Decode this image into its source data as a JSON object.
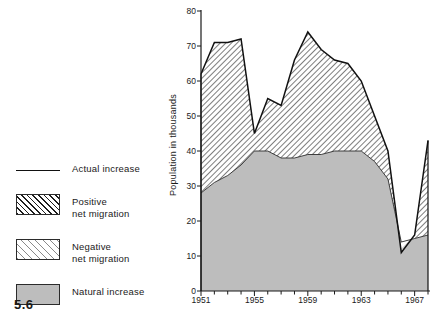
{
  "figure_number": "5.6",
  "legend": {
    "items": [
      {
        "label": "Actual increase",
        "swatch": "solid-line-swatch",
        "style": "line"
      },
      {
        "label": "Positive\nnet migration",
        "swatch": "dense-hatch-swatch",
        "style": "pos"
      },
      {
        "label": "Negative\nnet migration",
        "swatch": "sparse-hatch-swatch",
        "style": "neg"
      },
      {
        "label": "Natural increase",
        "swatch": "solid-gray-swatch",
        "style": "nat"
      }
    ]
  },
  "colors": {
    "natural_fill": "#bdbdbd",
    "hatch_dark": "#1d1d1d",
    "hatch_light": "#8a8a8a",
    "axis": "#1a1a1a"
  },
  "chart_data": {
    "type": "area",
    "title": "",
    "xlabel": "",
    "ylabel": "Population in thousands",
    "xlim": [
      1951,
      1968
    ],
    "ylim": [
      0,
      80
    ],
    "grid": false,
    "legend_position": "left-outside",
    "x_tick_labels": [
      "1951",
      "1955",
      "1959",
      "1963",
      "1967"
    ],
    "x_tick_values": [
      1951,
      1955,
      1959,
      1963,
      1967
    ],
    "x_minor_ticks": [
      1952,
      1953,
      1954,
      1956,
      1957,
      1958,
      1960,
      1961,
      1962,
      1964,
      1965,
      1966,
      1968
    ],
    "y_tick_labels": [
      "0",
      "10",
      "20",
      "30",
      "40",
      "50",
      "60",
      "70",
      "80"
    ],
    "y_tick_values": [
      0,
      10,
      20,
      30,
      40,
      50,
      60,
      70,
      80
    ],
    "x": [
      1951,
      1952,
      1953,
      1954,
      1955,
      1956,
      1957,
      1958,
      1959,
      1960,
      1961,
      1962,
      1963,
      1964,
      1965,
      1966,
      1967,
      1968
    ],
    "series": [
      {
        "name": "Actual increase",
        "values": [
          62,
          71,
          71,
          72,
          45,
          55,
          53,
          66,
          74,
          69,
          66,
          65,
          60,
          50,
          40,
          11,
          16,
          43
        ]
      },
      {
        "name": "Natural increase",
        "values": [
          28,
          31,
          33,
          36,
          40,
          40,
          38,
          38,
          39,
          39,
          40,
          40,
          40,
          37,
          32,
          14,
          15,
          16
        ]
      }
    ],
    "annotations": [
      {
        "text": "Positive net migration",
        "meaning": "area between actual increase and natural increase where actual exceeds natural"
      },
      {
        "text": "Negative net migration",
        "meaning": "area between natural increase and actual increase where actual falls below natural (around 1966)"
      }
    ]
  }
}
